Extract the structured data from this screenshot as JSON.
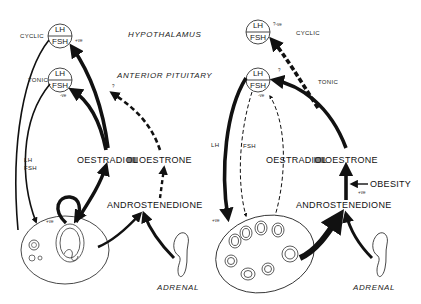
{
  "figure": {
    "type": "endocrine feedback diagram",
    "panels": [
      {
        "id": "left",
        "description": "Normal cycle",
        "hypothalamus_unit": {
          "top": "LH",
          "bottom": "FSH",
          "label": "CYCLIC",
          "annotation": "+ve"
        },
        "pituitary_unit": {
          "top": "LH",
          "bottom": "FSH",
          "label": "TONIC",
          "annotation": "-ve"
        },
        "pathway_label": "LH\nFSH",
        "pathway_label_lh": "LH",
        "pathway_label_fsh": "FSH",
        "ovary_annotation": "+ve",
        "oestrone_annotation": "?",
        "oestradiol": "OESTRADIOL",
        "oestrone": "OESTRONE",
        "androstenedione": "ANDROSTENEDIONE",
        "adrenal": "ADRENAL"
      },
      {
        "id": "right",
        "description": "Polycystic ovary / obesity",
        "hypothalamus_unit": {
          "top": "LH",
          "bottom": "FSH",
          "label": "CYCLIC",
          "annotation": "?-ve"
        },
        "pituitary_unit": {
          "top": "LH",
          "bottom": "FSH",
          "label": "TONIC",
          "annotation_top": "?",
          "annotation": "-ve"
        },
        "pathway_label_lh": "LH",
        "pathway_label_fsh": "FSH",
        "ovary_annotation": "+ve",
        "oestradiol": "OESTRADIOL",
        "oestrone": "OESTRONE",
        "androstenedione": "ANDROSTENEDIONE",
        "obesity": "OBESITY",
        "obesity_annotation": "+ve",
        "adrenal": "ADRENAL"
      }
    ],
    "level_labels": {
      "hypothalamus": "HYPOTHALAMUS",
      "pituitary": "ANTERIOR PITUITARY"
    },
    "equilibrium_symbol": "⇌"
  }
}
